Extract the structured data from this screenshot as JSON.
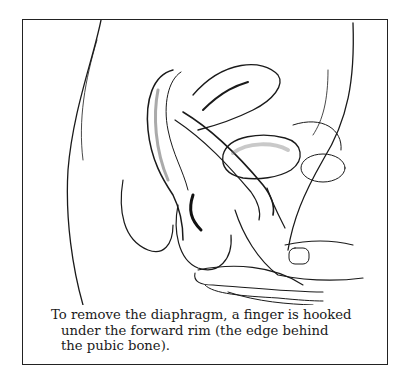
{
  "figure": {
    "illustration": {
      "subject": "side-view anatomical drawing of hand removing diaphragm",
      "stroke_color": "#1a1a1a"
    },
    "caption": {
      "lines": [
        "To remove the diaphragm, a finger is hooked",
        "under the forward rim (the edge behind",
        "the pubic bone)."
      ]
    }
  }
}
